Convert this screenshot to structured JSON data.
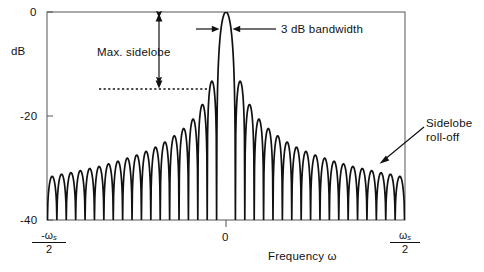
{
  "figure": {
    "kind": "window-spectrum-annotated-plot",
    "background": "#ffffff",
    "ink_color": "#111111"
  },
  "axes": {
    "y_label": "dB",
    "y_ticks": [
      "0",
      "-20",
      "-40"
    ],
    "y_tick_values": [
      0,
      -20,
      -40
    ],
    "x_label": "Frequency ω",
    "x_tick_left_num": "-ω",
    "x_tick_left_sub": "s",
    "x_tick_left_den": "2",
    "x_tick_center": "0",
    "x_tick_right_num": "ω",
    "x_tick_right_sub": "s",
    "x_tick_right_den": "2"
  },
  "annotations": {
    "max_sidelobe": "Max. sidelobe",
    "bandwidth": "3 dB  bandwidth",
    "rolloff_line1": "Sidelobe",
    "rolloff_line2": "roll-off"
  },
  "chart_data": {
    "type": "line",
    "title": "",
    "xlabel": "Frequency ω",
    "ylabel": "dB",
    "xlim": [
      -1,
      1
    ],
    "ylim": [
      -40,
      0
    ],
    "xtick_labels": [
      "-ωs/2",
      "0",
      "ωs/2"
    ],
    "xtick_values": [
      -1,
      0,
      1
    ],
    "ytick_labels": [
      "0",
      "-20",
      "-40"
    ],
    "ytick_values": [
      0,
      -20,
      -40
    ],
    "grid": false,
    "legend": null,
    "series": [
      {
        "name": "Window magnitude spectrum (dB)",
        "description": "Dirichlet/sinc-like window spectrum: main lobe peaking at 0 dB at omega=0, with 18 sidelobes on each side whose peaks decay from about -13 dB nearest the main lobe to about -32 dB at +/- omega_s/2. Nulls reach the -40 dB floor between lobes.",
        "n_lobes_per_side": 18,
        "mainlobe_peak_db": 0,
        "mainlobe_half_width_norm": 0.055,
        "sidelobe_peaks_db_right": [
          -13.3,
          -17.8,
          -20.6,
          -22.4,
          -23.8,
          -25.0,
          -26.0,
          -26.8,
          -27.5,
          -28.1,
          -28.7,
          -29.2,
          -29.7,
          -30.1,
          -30.5,
          -30.9,
          -31.2,
          -31.6
        ],
        "sidelobe_peaks_db_left": [
          -13.3,
          -17.8,
          -20.6,
          -22.4,
          -23.8,
          -25.0,
          -26.0,
          -26.8,
          -27.5,
          -28.1,
          -28.7,
          -29.2,
          -29.7,
          -30.1,
          -30.5,
          -30.9,
          -31.2,
          -31.6
        ],
        "null_floor_db": -40
      }
    ],
    "annotations": [
      {
        "name": "max-sidelobe",
        "text": "Max. sidelobe",
        "kind": "double-headed-vertical-arrow",
        "from_db": 0,
        "to_db": -13.3,
        "dashed_reference_level_db": -13.3
      },
      {
        "name": "3db-bandwidth",
        "text": "3 dB  bandwidth",
        "kind": "inward-horizontal-arrows",
        "at_db": -3
      },
      {
        "name": "sidelobe-roll-off",
        "text": "Sidelobe roll-off",
        "kind": "leader-arrow",
        "points_to_norm_x": 0.72
      }
    ]
  }
}
